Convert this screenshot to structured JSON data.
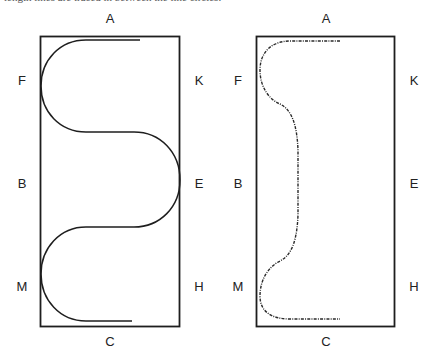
{
  "caption": "length lines are traced in between the line circles.",
  "colors": {
    "stroke": "#1e1e1e",
    "label": "#222222",
    "background": "#ffffff"
  },
  "figures": [
    {
      "name": "serpentine-path",
      "style": "solid",
      "labels": {
        "top": "A",
        "bottom": "C",
        "left": [
          "F",
          "B",
          "M"
        ],
        "right": [
          "K",
          "E",
          "H"
        ]
      }
    },
    {
      "name": "dotted-path",
      "style": "dash-dot",
      "labels": {
        "top": "A",
        "bottom": "C",
        "left": [
          "F",
          "B",
          "M"
        ],
        "right": [
          "K",
          "E",
          "H"
        ]
      }
    }
  ]
}
